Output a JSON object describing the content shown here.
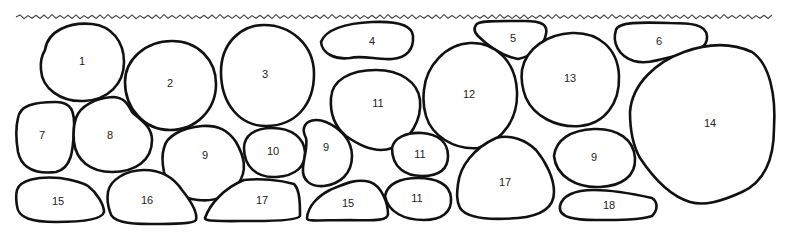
{
  "diagram": {
    "type": "stone-layout",
    "ground_line": {
      "x_start": 16,
      "x_end": 775,
      "y": 17
    },
    "stones": [
      {
        "id": "1",
        "label": "1",
        "cx": 82,
        "cy": 62,
        "path": "M45,50 C48,30 70,22 92,24 C112,26 124,42 124,62 C124,84 108,100 84,101 C60,102 42,88 41,70 C40,60 42,55 45,50 Z"
      },
      {
        "id": "2",
        "label": "2",
        "cx": 170,
        "cy": 84,
        "path": "M125,82 C125,60 145,41 172,41 C198,41 216,60 216,84 C216,110 196,130 170,130 C144,130 125,108 125,82 Z"
      },
      {
        "id": "3",
        "label": "3",
        "cx": 265,
        "cy": 75,
        "path": "M221,72 C221,44 240,25 264,25 C290,25 314,44 314,74 C314,104 296,126 266,126 C240,126 221,104 221,72 Z"
      },
      {
        "id": "4",
        "label": "4",
        "cx": 372,
        "cy": 42,
        "path": "M321,42 C325,30 345,23 372,22 C395,21 412,24 413,36 C414,50 406,58 392,59 C378,60 362,55 350,58 C336,60 322,54 321,42 Z"
      },
      {
        "id": "5",
        "label": "5",
        "cx": 513,
        "cy": 39,
        "path": "M476,25 C478,20 500,21 525,21 C542,21 548,25 546,34 C544,46 532,56 518,59 C502,56 488,46 478,36 C474,32 474,28 476,25 Z"
      },
      {
        "id": "6",
        "label": "6",
        "cx": 659,
        "cy": 42,
        "path": "M616,30 C618,22 640,22 670,23 C690,23 706,24 707,36 C708,48 696,52 680,55 C664,58 648,65 634,61 C618,56 612,42 616,30 Z"
      },
      {
        "id": "7",
        "label": "7",
        "cx": 42,
        "cy": 136,
        "path": "M18,118 C20,106 32,102 56,102 C72,102 75,112 74,130 C73,150 72,168 56,172 C38,174 22,170 18,152 C16,140 16,126 18,118 Z"
      },
      {
        "id": "8",
        "label": "8",
        "cx": 110,
        "cy": 136,
        "path": "M76,118 C80,106 96,98 112,97 C124,97 128,104 132,112 C140,120 152,126 152,140 C152,160 136,172 112,172 C90,172 76,160 74,142 C73,132 74,124 76,118 Z"
      },
      {
        "id": "9a",
        "label": "9",
        "cx": 205,
        "cy": 156,
        "path": "M164,148 C166,136 182,128 202,126 C218,125 228,130 236,142 C244,156 248,170 238,184 C228,196 214,202 198,200 C180,198 168,188 164,172 C162,162 162,154 164,148 Z"
      },
      {
        "id": "10",
        "label": "10",
        "cx": 273,
        "cy": 152,
        "path": "M244,148 C244,136 254,128 272,128 C292,128 304,138 305,152 C306,166 296,176 276,177 C256,178 244,166 244,148 Z"
      },
      {
        "id": "9b",
        "label": "9",
        "cx": 326,
        "cy": 148,
        "path": "M304,128 C306,120 316,118 326,122 C340,128 352,140 352,156 C352,174 340,184 324,186 C310,187 302,180 303,168 C304,156 308,146 306,138 C304,134 303,131 304,128 Z"
      },
      {
        "id": "11a",
        "label": "11",
        "cx": 378,
        "cy": 104,
        "path": "M331,98 C332,80 350,70 376,70 C400,70 418,82 420,100 C422,120 410,140 392,148 C376,154 360,146 346,136 C334,126 330,112 331,98 Z"
      },
      {
        "id": "11b",
        "label": "11",
        "cx": 420,
        "cy": 155,
        "path": "M392,148 C394,138 406,132 422,133 C438,134 448,142 448,156 C448,170 438,176 422,176 C406,176 392,168 392,148 Z"
      },
      {
        "id": "11c",
        "label": "11",
        "cx": 417,
        "cy": 199,
        "path": "M385,196 C387,184 400,178 418,178 C436,178 450,184 451,198 C452,212 442,220 424,220 C404,220 388,212 385,196 Z"
      },
      {
        "id": "12",
        "label": "12",
        "cx": 469,
        "cy": 95,
        "path": "M424,90 C426,66 446,44 470,43 C496,42 516,62 517,92 C518,118 504,140 478,148 C454,150 432,136 426,116 C423,106 423,98 424,90 Z"
      },
      {
        "id": "13",
        "label": "13",
        "cx": 570,
        "cy": 79,
        "path": "M522,70 C526,48 548,34 572,33 C598,32 618,48 619,76 C620,104 604,124 580,126 C556,128 534,116 526,98 C522,88 521,78 522,70 Z"
      },
      {
        "id": "14",
        "label": "14",
        "cx": 710,
        "cy": 124,
        "path": "M630,112 C632,84 656,62 684,52 C706,44 730,42 752,52 C770,64 776,96 774,128 C774,160 764,182 742,192 C720,202 704,206 690,202 C670,196 652,176 640,158 C632,144 630,128 630,112 Z"
      },
      {
        "id": "15a",
        "label": "15",
        "cx": 58,
        "cy": 202,
        "path": "M17,190 C20,180 38,176 60,178 C72,180 82,182 88,186 C96,192 104,204 104,212 C102,220 80,222 56,222 C32,222 18,218 17,206 C16,200 16,194 17,190 Z"
      },
      {
        "id": "15b",
        "label": "15",
        "cx": 348,
        "cy": 204,
        "path": "M307,218 C308,206 318,196 330,190 C344,184 356,178 370,182 C382,186 388,204 388,214 C388,220 378,221 350,220 C322,220 306,222 307,218 Z"
      },
      {
        "id": "16",
        "label": "16",
        "cx": 147,
        "cy": 201,
        "path": "M108,192 C110,180 126,170 144,170 C162,170 174,178 182,190 C190,200 198,212 196,220 C194,224 172,224 150,224 C128,224 112,222 110,212 C108,206 107,198 108,192 Z"
      },
      {
        "id": "17a",
        "label": "17",
        "cx": 262,
        "cy": 201,
        "path": "M205,218 C210,204 224,188 244,180 C260,178 280,180 294,184 C300,190 300,204 300,216 C298,220 280,221 254,221 C228,221 204,222 205,218 Z"
      },
      {
        "id": "17b",
        "label": "17",
        "cx": 505,
        "cy": 183,
        "path": "M458,184 C460,166 474,148 496,138 C510,134 526,140 536,150 C546,162 554,178 554,192 C554,208 540,216 518,218 C494,220 468,220 460,208 C456,200 457,192 458,184 Z"
      },
      {
        "id": "9c",
        "label": "9",
        "cx": 594,
        "cy": 158,
        "path": "M554,156 C556,140 570,130 594,129 C618,128 634,140 635,158 C636,176 622,186 600,187 C576,188 556,176 554,156 Z"
      },
      {
        "id": "18",
        "label": "18",
        "cx": 609,
        "cy": 206,
        "path": "M560,206 C562,196 574,190 594,190 C612,190 634,194 652,198 C658,202 658,210 652,216 C640,220 620,220 596,220 C576,220 558,218 560,206 Z"
      }
    ]
  }
}
